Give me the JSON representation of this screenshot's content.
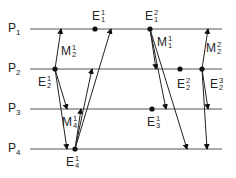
{
  "diagram": {
    "type": "space-time process diagram",
    "processes": [
      {
        "label": "P",
        "index": "1",
        "y": 29
      },
      {
        "label": "P",
        "index": "2",
        "y": 69
      },
      {
        "label": "P",
        "index": "3",
        "y": 109
      },
      {
        "label": "P",
        "index": "4",
        "y": 149
      }
    ],
    "line": {
      "x_start": 30,
      "x_end": 222,
      "color": "#555555"
    },
    "events": [
      {
        "id": "E1_1",
        "base": "E",
        "sub": "1",
        "sup": "1",
        "x": 95,
        "y": 29,
        "lx": 92,
        "ly": 10
      },
      {
        "id": "E1_2",
        "base": "E",
        "sub": "1",
        "sup": "2",
        "x": 150,
        "y": 29,
        "lx": 145,
        "ly": 10
      },
      {
        "id": "E2_1",
        "base": "E",
        "sub": "2",
        "sup": "1",
        "x": 55,
        "y": 69,
        "lx": 38,
        "ly": 76
      },
      {
        "id": "E2_2",
        "base": "E",
        "sub": "2",
        "sup": "2",
        "x": 180,
        "y": 69,
        "lx": 177,
        "ly": 78
      },
      {
        "id": "E2_3",
        "base": "E",
        "sub": "2",
        "sup": "3",
        "x": 202,
        "y": 69,
        "lx": 210,
        "ly": 78
      },
      {
        "id": "E3_1",
        "base": "E",
        "sub": "3",
        "sup": "1",
        "x": 152,
        "y": 109,
        "lx": 147,
        "ly": 116
      },
      {
        "id": "E4_1",
        "base": "E",
        "sub": "4",
        "sup": "1",
        "x": 75,
        "y": 149,
        "lx": 66,
        "ly": 156
      }
    ],
    "messages": [
      {
        "from": [
          55,
          69
        ],
        "to": [
          61,
          29
        ]
      },
      {
        "from": [
          55,
          69
        ],
        "to": [
          67,
          109
        ]
      },
      {
        "from": [
          55,
          69
        ],
        "to": [
          67,
          149
        ]
      },
      {
        "from": [
          75,
          149
        ],
        "to": [
          81,
          109
        ]
      },
      {
        "from": [
          75,
          149
        ],
        "to": [
          92,
          69
        ]
      },
      {
        "from": [
          75,
          149
        ],
        "to": [
          111,
          29
        ]
      },
      {
        "from": [
          150,
          29
        ],
        "to": [
          156,
          69
        ]
      },
      {
        "from": [
          150,
          29
        ],
        "to": [
          166,
          109
        ]
      },
      {
        "from": [
          150,
          29
        ],
        "to": [
          187,
          149
        ]
      },
      {
        "from": [
          202,
          69
        ],
        "to": [
          208,
          29
        ]
      },
      {
        "from": [
          202,
          69
        ],
        "to": [
          208,
          109
        ]
      },
      {
        "from": [
          202,
          69
        ],
        "to": [
          207,
          149
        ]
      }
    ],
    "message_labels": [
      {
        "id": "M2_1",
        "base": "M",
        "sub": "2",
        "sup": "1",
        "x": 61,
        "y": 45
      },
      {
        "id": "M4_1",
        "base": "M",
        "sub": "4",
        "sup": "1",
        "x": 62,
        "y": 116
      },
      {
        "id": "M1_1",
        "base": "M",
        "sub": "1",
        "sup": "1",
        "x": 157,
        "y": 36
      },
      {
        "id": "M2_2",
        "base": "M",
        "sub": "2",
        "sup": "2",
        "x": 206,
        "y": 42
      }
    ]
  }
}
